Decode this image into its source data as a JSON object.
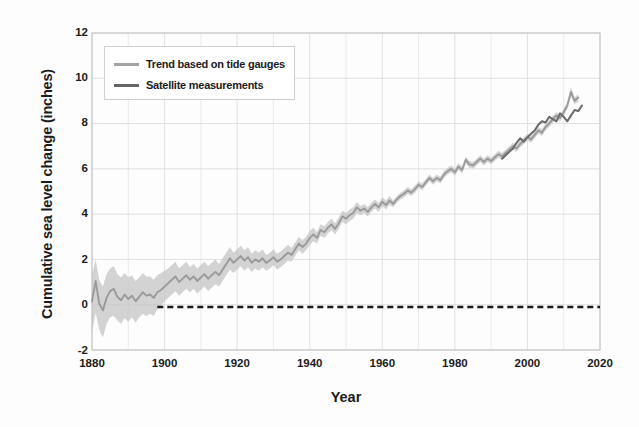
{
  "chart_data": {
    "type": "line",
    "title": "",
    "xlabel": "Year",
    "ylabel": "Cumulative sea level change (inches)",
    "xlim": [
      1880,
      2020
    ],
    "ylim": [
      -2,
      12
    ],
    "xticks": [
      1880,
      1900,
      1920,
      1940,
      1960,
      1980,
      2000,
      2020
    ],
    "yticks": [
      -2,
      0,
      2,
      4,
      6,
      8,
      10,
      12
    ],
    "grid": true,
    "grid_minor_x_step": 10,
    "legend_position": "upper-left",
    "colors": {
      "trend_line": "#9a9a9a",
      "trend_band": "#c4c4c4",
      "satellite_line": "#6a6a6a",
      "zero_reference": "#1a1a1a",
      "grid": "#dddddd",
      "axis": "#c8c8c8",
      "text": "#1b1b1b",
      "background": "#fdfdfd"
    },
    "zero_reference": {
      "label": "",
      "value": -0.1,
      "x_start": 1898,
      "x_end": 2020,
      "style": "dashed"
    },
    "series": [
      {
        "name": "Trend based on tide gauges",
        "style": "line-with-band",
        "color": "#9a9a9a",
        "band_color": "#c4c4c4",
        "x": [
          1880,
          1881,
          1882,
          1883,
          1884,
          1885,
          1886,
          1887,
          1888,
          1889,
          1890,
          1891,
          1892,
          1893,
          1894,
          1895,
          1896,
          1897,
          1898,
          1899,
          1900,
          1901,
          1902,
          1903,
          1904,
          1905,
          1906,
          1907,
          1908,
          1909,
          1910,
          1911,
          1912,
          1913,
          1914,
          1915,
          1916,
          1917,
          1918,
          1919,
          1920,
          1921,
          1922,
          1923,
          1924,
          1925,
          1926,
          1927,
          1928,
          1929,
          1930,
          1931,
          1932,
          1933,
          1934,
          1935,
          1936,
          1937,
          1938,
          1939,
          1940,
          1941,
          1942,
          1943,
          1944,
          1945,
          1946,
          1947,
          1948,
          1949,
          1950,
          1951,
          1952,
          1953,
          1954,
          1955,
          1956,
          1957,
          1958,
          1959,
          1960,
          1961,
          1962,
          1963,
          1964,
          1965,
          1966,
          1967,
          1968,
          1969,
          1970,
          1971,
          1972,
          1973,
          1974,
          1975,
          1976,
          1977,
          1978,
          1979,
          1980,
          1981,
          1982,
          1983,
          1984,
          1985,
          1986,
          1987,
          1988,
          1989,
          1990,
          1991,
          1992,
          1993,
          1994,
          1995,
          1996,
          1997,
          1998,
          1999,
          2000,
          2001,
          2002,
          2003,
          2004,
          2005,
          2006,
          2007,
          2008,
          2009,
          2010,
          2011,
          2012,
          2013,
          2014
        ],
        "y": [
          0.15,
          1.05,
          0.05,
          -0.25,
          0.3,
          0.6,
          0.7,
          0.35,
          0.2,
          0.45,
          0.25,
          0.4,
          0.15,
          0.35,
          0.55,
          0.4,
          0.45,
          0.3,
          0.55,
          0.65,
          0.8,
          0.95,
          1.1,
          1.25,
          1.0,
          1.15,
          1.3,
          1.1,
          1.25,
          1.05,
          1.2,
          1.35,
          1.15,
          1.3,
          1.45,
          1.3,
          1.55,
          1.8,
          2.05,
          1.85,
          2.0,
          2.15,
          1.95,
          2.1,
          1.85,
          2.0,
          1.9,
          2.05,
          1.85,
          1.95,
          2.1,
          1.9,
          2.0,
          2.15,
          2.3,
          2.2,
          2.45,
          2.7,
          2.55,
          2.7,
          2.95,
          3.1,
          2.95,
          3.3,
          3.2,
          3.4,
          3.55,
          3.35,
          3.6,
          3.9,
          3.8,
          3.95,
          4.05,
          4.3,
          4.15,
          4.25,
          4.1,
          4.3,
          4.45,
          4.3,
          4.55,
          4.4,
          4.6,
          4.45,
          4.65,
          4.8,
          4.9,
          5.05,
          4.95,
          5.1,
          5.3,
          5.2,
          5.4,
          5.6,
          5.45,
          5.6,
          5.5,
          5.75,
          5.9,
          6.0,
          5.85,
          6.1,
          5.95,
          6.4,
          6.2,
          6.15,
          6.3,
          6.45,
          6.3,
          6.45,
          6.35,
          6.5,
          6.65,
          6.55,
          6.7,
          6.85,
          7.0,
          6.9,
          7.1,
          7.25,
          7.4,
          7.3,
          7.5,
          7.7,
          7.6,
          7.85,
          8.0,
          8.2,
          8.35,
          8.25,
          8.5,
          8.8,
          9.4,
          9.0,
          9.15
        ],
        "band_lower": [
          -1.25,
          -0.35,
          -1.1,
          -1.45,
          -0.85,
          -0.55,
          -0.5,
          -0.7,
          -0.85,
          -0.6,
          -0.75,
          -0.55,
          -0.8,
          -0.55,
          -0.4,
          -0.5,
          -0.4,
          -0.5,
          -0.2,
          -0.05,
          0.15,
          0.3,
          0.45,
          0.6,
          0.4,
          0.55,
          0.7,
          0.55,
          0.7,
          0.5,
          0.65,
          0.8,
          0.6,
          0.75,
          0.9,
          0.8,
          1.05,
          1.3,
          1.55,
          1.4,
          1.55,
          1.7,
          1.5,
          1.65,
          1.45,
          1.6,
          1.5,
          1.65,
          1.5,
          1.6,
          1.75,
          1.55,
          1.65,
          1.8,
          1.95,
          1.9,
          2.15,
          2.4,
          2.25,
          2.4,
          2.65,
          2.8,
          2.7,
          3.05,
          2.95,
          3.15,
          3.3,
          3.1,
          3.35,
          3.65,
          3.55,
          3.7,
          3.8,
          4.05,
          3.95,
          4.05,
          3.9,
          4.1,
          4.25,
          4.1,
          4.35,
          4.2,
          4.4,
          4.3,
          4.5,
          4.65,
          4.75,
          4.9,
          4.8,
          4.95,
          5.15,
          5.05,
          5.25,
          5.45,
          5.3,
          5.45,
          5.35,
          5.6,
          5.75,
          5.85,
          5.7,
          5.95,
          5.8,
          6.25,
          6.05,
          6.0,
          6.15,
          6.3,
          6.15,
          6.3,
          6.2,
          6.35,
          6.5,
          6.4,
          6.55,
          6.7,
          6.85,
          6.75,
          6.95,
          7.1,
          7.25,
          7.15,
          7.35,
          7.55,
          7.45,
          7.7,
          7.85,
          8.05,
          8.2,
          8.1,
          8.35,
          8.65,
          9.2,
          8.85,
          8.95
        ],
        "band_upper": [
          1.3,
          2.0,
          1.1,
          0.8,
          1.35,
          1.6,
          1.7,
          1.35,
          1.2,
          1.4,
          1.2,
          1.3,
          1.05,
          1.2,
          1.4,
          1.25,
          1.25,
          1.1,
          1.3,
          1.4,
          1.5,
          1.6,
          1.75,
          1.9,
          1.6,
          1.75,
          1.9,
          1.65,
          1.8,
          1.6,
          1.75,
          1.9,
          1.7,
          1.85,
          2.0,
          1.8,
          2.05,
          2.3,
          2.55,
          2.3,
          2.45,
          2.6,
          2.4,
          2.55,
          2.25,
          2.4,
          2.3,
          2.45,
          2.2,
          2.3,
          2.45,
          2.25,
          2.35,
          2.5,
          2.65,
          2.5,
          2.75,
          3.0,
          2.85,
          3.0,
          3.25,
          3.4,
          3.2,
          3.55,
          3.45,
          3.65,
          3.8,
          3.6,
          3.85,
          4.15,
          4.05,
          4.2,
          4.3,
          4.55,
          4.35,
          4.45,
          4.3,
          4.5,
          4.65,
          4.5,
          4.75,
          4.6,
          4.8,
          4.6,
          4.8,
          4.95,
          5.05,
          5.2,
          5.1,
          5.25,
          5.45,
          5.35,
          5.55,
          5.75,
          5.6,
          5.75,
          5.65,
          5.9,
          6.05,
          6.15,
          6.0,
          6.25,
          6.1,
          6.55,
          6.35,
          6.3,
          6.45,
          6.6,
          6.45,
          6.6,
          6.5,
          6.65,
          6.8,
          6.7,
          6.85,
          7.0,
          7.15,
          7.05,
          7.25,
          7.4,
          7.55,
          7.45,
          7.65,
          7.85,
          7.75,
          8.0,
          8.15,
          8.35,
          8.5,
          8.4,
          8.65,
          8.95,
          9.6,
          9.15,
          9.3
        ]
      },
      {
        "name": "Satellite measurements",
        "style": "line",
        "color": "#6a6a6a",
        "x": [
          1993,
          1994,
          1995,
          1996,
          1997,
          1998,
          1999,
          2000,
          2001,
          2002,
          2003,
          2004,
          2005,
          2006,
          2007,
          2008,
          2009,
          2010,
          2011,
          2012,
          2013,
          2014,
          2015
        ],
        "y": [
          6.45,
          6.6,
          6.75,
          6.9,
          7.15,
          7.35,
          7.2,
          7.4,
          7.55,
          7.7,
          7.95,
          8.1,
          8.05,
          8.3,
          8.2,
          8.1,
          8.45,
          8.3,
          8.1,
          8.35,
          8.6,
          8.55,
          8.8
        ]
      }
    ]
  },
  "legend": {
    "items": [
      {
        "label": "Trend based on tide gauges",
        "color": "#a3a3a3",
        "width": 3
      },
      {
        "label": "Satellite measurements",
        "color": "#666666",
        "width": 3
      }
    ]
  },
  "axes": {
    "y_tick_labels": [
      "12",
      "10",
      "8",
      "6",
      "4",
      "2",
      "0",
      "-2"
    ],
    "x_tick_labels": [
      "1880",
      "1900",
      "1920",
      "1940",
      "1960",
      "1980",
      "2000",
      "2020"
    ],
    "y_title": "Cumulative sea level change (inches)",
    "x_title": "Year"
  }
}
